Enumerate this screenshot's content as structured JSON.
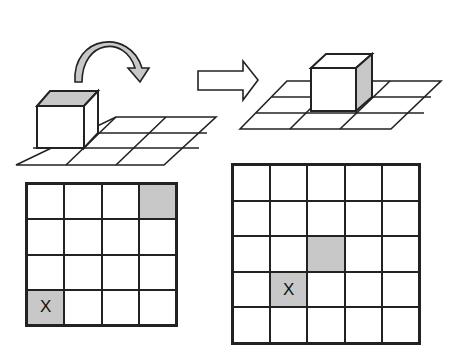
{
  "diagram": {
    "colors": {
      "line": "#222222",
      "shade": "#c8c8c8",
      "background": "#ffffff"
    },
    "top_left": {
      "type": "cube-on-3x2-grid",
      "arrow": "curved-roll-arrow",
      "shaded_face": "top"
    },
    "top_arrow": {
      "type": "right-arrow"
    },
    "top_right": {
      "type": "cube-on-3x3-grid",
      "shaded_face": "right"
    },
    "grid_left": {
      "rows": 4,
      "cols": 4,
      "shaded": [
        [
          0,
          3
        ],
        [
          3,
          0
        ]
      ],
      "marker": {
        "row": 3,
        "col": 0,
        "label": "X"
      }
    },
    "grid_right": {
      "rows": 5,
      "cols": 5,
      "shaded": [
        [
          2,
          2
        ],
        [
          3,
          1
        ]
      ],
      "marker": {
        "row": 3,
        "col": 1,
        "label": "X"
      }
    }
  }
}
